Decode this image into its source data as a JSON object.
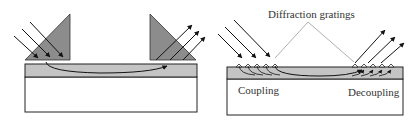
{
  "figure": {
    "left_panel": {
      "description": "Prism coupling",
      "prisms": [
        "input-prism",
        "output-prism"
      ],
      "incident_beams": 3,
      "output_beams": 3
    },
    "right_panel": {
      "description": "Grating coupling",
      "label_gratings": "Diffraction gratings",
      "label_coupling": "Coupling",
      "label_decoupling": "Decoupling",
      "incident_beams": 3,
      "output_beams": 3
    },
    "colors": {
      "prism_fill": "#8c8c8c",
      "film_fill": "#c4c4c4",
      "substrate_fill": "#ffffff",
      "stroke": "#222222",
      "leader_line": "#9a9a9a"
    }
  }
}
